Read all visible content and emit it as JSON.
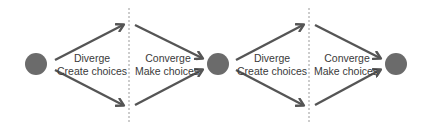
{
  "colors": {
    "node": "#6b6b6b",
    "arrow": "#555555",
    "divider": "#9a9a9a",
    "text": "#3a3a3a",
    "background": "#ffffff"
  },
  "stages": [
    {
      "title": "Diverge",
      "subtitle": "Create choices"
    },
    {
      "title": "Converge",
      "subtitle": "Make choices"
    },
    {
      "title": "Diverge",
      "subtitle": "Create choices"
    },
    {
      "title": "Converge",
      "subtitle": "Make choices"
    }
  ],
  "nodes": [
    {
      "id": "start"
    },
    {
      "id": "middle"
    },
    {
      "id": "end"
    }
  ]
}
